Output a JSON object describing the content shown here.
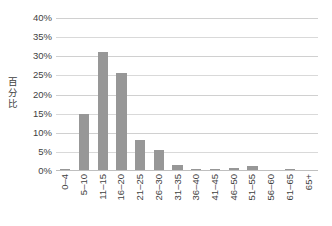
{
  "chart_data": {
    "type": "bar",
    "title": "",
    "subtitle": "",
    "xlabel": "",
    "ylabel": "百分比",
    "ylim": [
      0,
      40
    ],
    "ytick_labels": [
      "40%",
      "35%",
      "30%",
      "25%",
      "20%",
      "15%",
      "10%",
      "5%",
      "0%"
    ],
    "ytick_values": [
      40,
      35,
      30,
      25,
      20,
      15,
      10,
      5,
      0
    ],
    "grid": true,
    "legend": false,
    "bar_color": "#979797",
    "gridline_color": "#d9d9d9",
    "axis_color": "#bfbfbf",
    "categories": [
      "0–4",
      "5–10",
      "11–15",
      "16–20",
      "21–25",
      "26–30",
      "31–35",
      "36–40",
      "41–45",
      "46–50",
      "51–55",
      "56–60",
      "61–65",
      "65+"
    ],
    "values": [
      0.5,
      15.0,
      31.0,
      25.5,
      8.0,
      5.5,
      1.5,
      0.6,
      0.5,
      0.8,
      1.3,
      0.2,
      0.4,
      0.3
    ],
    "value_unit": "%",
    "series": [
      {
        "name": "",
        "values": [
          0.5,
          15.0,
          31.0,
          25.5,
          8.0,
          5.5,
          1.5,
          0.6,
          0.5,
          0.8,
          1.3,
          0.2,
          0.4,
          0.3
        ]
      }
    ]
  }
}
